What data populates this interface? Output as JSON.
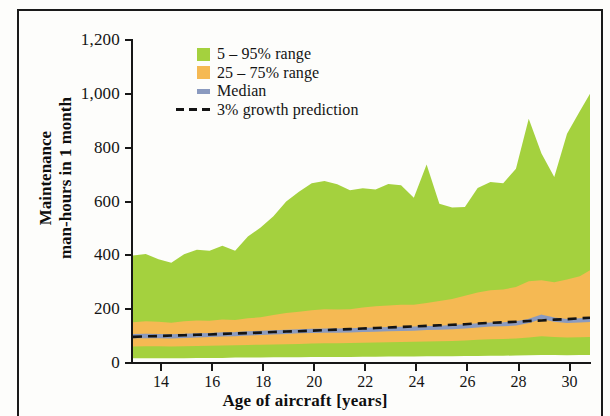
{
  "chart_data": {
    "type": "area",
    "title": "",
    "xlabel": "Age of aircraft [years]",
    "ylabel": "Maintenance man-hours in 1 month",
    "ylabel_line1": "Maintenance",
    "ylabel_line2": "man-hours in 1 month",
    "xlim": [
      12.9,
      30.8
    ],
    "ylim": [
      0,
      1200
    ],
    "ytick_values": [
      0,
      200,
      400,
      600,
      800,
      1000,
      1200
    ],
    "ytick_labels": [
      "0",
      "200",
      "400",
      "600",
      "800",
      "1,000",
      "1,200"
    ],
    "xtick_values": [
      14,
      16,
      18,
      20,
      22,
      24,
      26,
      28,
      30
    ],
    "xtick_labels": [
      "14",
      "16",
      "18",
      "20",
      "22",
      "24",
      "26",
      "28",
      "30"
    ],
    "grid": false,
    "legend_position": "top-left-inside",
    "colors": {
      "range_5_95": "#a4d13e",
      "range_25_75": "#f5b953",
      "median": "#8a9abf",
      "prediction": "#141414",
      "axis": "#171717",
      "background": "#fdfdfb",
      "frame": "#1a1a1a"
    },
    "legend": [
      {
        "label": "5 – 95% range",
        "type": "swatch",
        "color": "#a4d13e",
        "key": "range_5_95"
      },
      {
        "label": "25 – 75% range",
        "type": "swatch",
        "color": "#f5b953",
        "key": "range_25_75"
      },
      {
        "label": "Median",
        "type": "line",
        "color": "#8a9abf",
        "key": "median"
      },
      {
        "label": "3% growth prediction",
        "type": "dashed",
        "color": "#141414",
        "key": "prediction"
      }
    ],
    "x": [
      12.9,
      13.4,
      13.9,
      14.4,
      14.9,
      15.4,
      15.9,
      16.4,
      16.9,
      17.4,
      17.9,
      18.4,
      18.9,
      19.4,
      19.9,
      20.4,
      20.9,
      21.4,
      21.9,
      22.4,
      22.9,
      23.4,
      23.9,
      24.4,
      24.9,
      25.4,
      25.9,
      26.4,
      26.9,
      27.4,
      27.9,
      28.4,
      28.9,
      29.4,
      29.9,
      30.4,
      30.8
    ],
    "series": [
      {
        "name": "95th percentile",
        "key": "p95",
        "values": [
          399,
          405,
          385,
          372,
          404,
          421,
          417,
          436,
          417,
          470,
          503,
          545,
          600,
          636,
          668,
          676,
          664,
          642,
          649,
          645,
          665,
          660,
          614,
          737,
          592,
          578,
          580,
          650,
          672,
          668,
          722,
          907,
          778,
          691,
          852,
          935,
          1000
        ]
      },
      {
        "name": "75th percentile",
        "key": "p75",
        "values": [
          151,
          155,
          153,
          150,
          155,
          158,
          157,
          162,
          160,
          166,
          170,
          178,
          186,
          190,
          196,
          200,
          199,
          200,
          206,
          211,
          214,
          216,
          216,
          223,
          230,
          238,
          250,
          262,
          270,
          273,
          282,
          304,
          307,
          300,
          310,
          322,
          345
        ]
      },
      {
        "name": "Median",
        "key": "median",
        "values": [
          100,
          101,
          100,
          99,
          101,
          103,
          104,
          106,
          107,
          110,
          112,
          114,
          116,
          118,
          119,
          120,
          120,
          121,
          123,
          124,
          126,
          127,
          128,
          130,
          131,
          133,
          136,
          140,
          143,
          144,
          147,
          156,
          172,
          161,
          156,
          158,
          160
        ]
      },
      {
        "name": "25th percentile",
        "key": "p25",
        "values": [
          61,
          62,
          62,
          61,
          62,
          63,
          64,
          65,
          66,
          67,
          68,
          69,
          70,
          71,
          72,
          73,
          73,
          74,
          75,
          76,
          77,
          78,
          79,
          80,
          81,
          82,
          84,
          86,
          88,
          89,
          91,
          95,
          99,
          97,
          95,
          96,
          97
        ]
      },
      {
        "name": "5th percentile",
        "key": "p5",
        "values": [
          18,
          18,
          18,
          18,
          18,
          19,
          19,
          19,
          20,
          20,
          20,
          21,
          21,
          21,
          22,
          22,
          22,
          22,
          23,
          23,
          24,
          24,
          24,
          25,
          25,
          25,
          26,
          26,
          27,
          27,
          28,
          29,
          30,
          30,
          29,
          30,
          30
        ]
      },
      {
        "name": "3% growth prediction",
        "key": "prediction",
        "values": [
          97,
          99,
          100,
          102,
          103,
          105,
          106,
          108,
          110,
          111,
          113,
          115,
          117,
          118,
          120,
          122,
          124,
          126,
          128,
          130,
          132,
          134,
          136,
          138,
          140,
          142,
          144,
          147,
          149,
          151,
          153,
          156,
          158,
          161,
          163,
          166,
          168
        ]
      }
    ]
  }
}
